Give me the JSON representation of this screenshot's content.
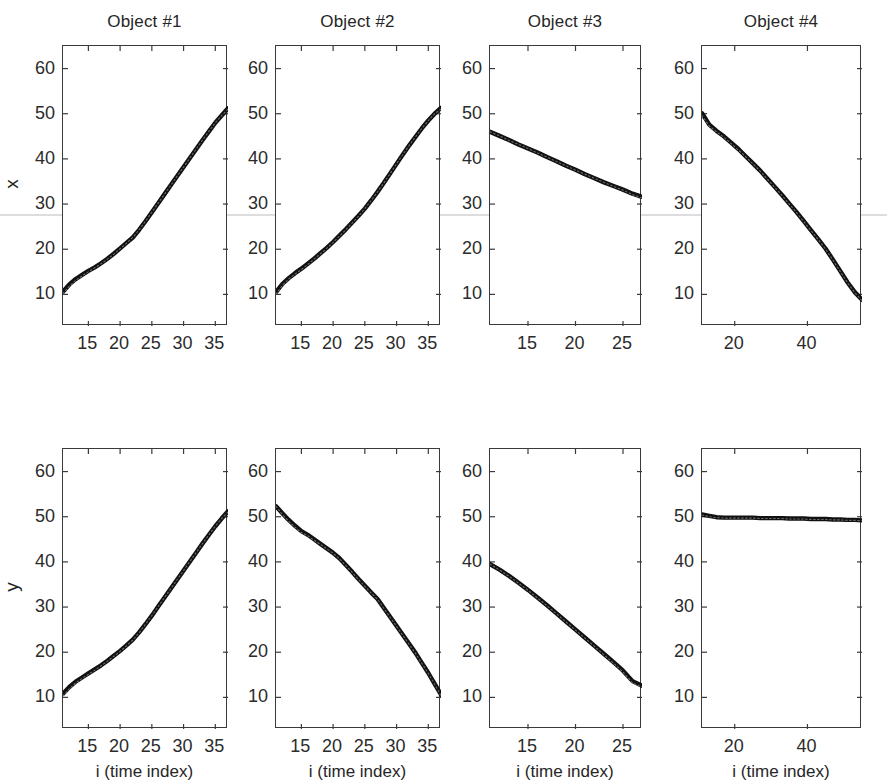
{
  "figure": {
    "row_labels": [
      "x",
      "y"
    ],
    "xlabel": "i (time index)"
  },
  "chart_data": [
    {
      "type": "line",
      "title": "Object #1",
      "panel": "row1-col1",
      "xlabel": "",
      "ylabel": "x",
      "xlim": [
        11,
        37
      ],
      "ylim": [
        3,
        65
      ],
      "xticks": [
        15,
        20,
        25,
        30,
        35
      ],
      "yticks": [
        10,
        20,
        30,
        40,
        50,
        60
      ],
      "grid": false,
      "series": [
        {
          "name": "measured",
          "style": "solid-thick",
          "x": [
            11,
            12,
            13,
            14,
            15,
            16,
            17,
            18,
            19,
            20,
            21,
            22,
            23,
            24,
            25,
            26,
            27,
            28,
            29,
            30,
            31,
            32,
            33,
            34,
            35,
            36,
            37
          ],
          "values": [
            10.6,
            12.2,
            13.4,
            14.3,
            15.2,
            16.0,
            16.9,
            17.9,
            19.0,
            20.2,
            21.4,
            22.6,
            24.3,
            26.2,
            28.2,
            30.2,
            32.2,
            34.2,
            36.2,
            38.2,
            40.2,
            42.2,
            44.2,
            46.1,
            48.0,
            49.6,
            51.2
          ]
        },
        {
          "name": "estimated",
          "style": "dotted-thin",
          "x": [
            11,
            12,
            13,
            14,
            15,
            16,
            17,
            18,
            19,
            20,
            21,
            22,
            23,
            24,
            25,
            26,
            27,
            28,
            29,
            30,
            31,
            32,
            33,
            34,
            35,
            36,
            37
          ],
          "values": [
            10.2,
            11.8,
            13.1,
            14.1,
            15.0,
            15.9,
            16.8,
            17.8,
            18.9,
            20.1,
            21.3,
            22.6,
            24.3,
            26.2,
            28.2,
            30.2,
            32.2,
            34.2,
            36.2,
            38.2,
            40.2,
            42.2,
            44.2,
            46.1,
            48.0,
            49.6,
            51.0
          ]
        }
      ]
    },
    {
      "type": "line",
      "title": "Object #2",
      "panel": "row1-col2",
      "xlabel": "",
      "ylabel": "x",
      "xlim": [
        11,
        37
      ],
      "ylim": [
        3,
        65
      ],
      "xticks": [
        15,
        20,
        25,
        30,
        35
      ],
      "yticks": [
        10,
        20,
        30,
        40,
        50,
        60
      ],
      "grid": false,
      "series": [
        {
          "name": "measured",
          "style": "solid-thick",
          "x": [
            11,
            12,
            13,
            14,
            15,
            16,
            17,
            18,
            19,
            20,
            21,
            22,
            23,
            24,
            25,
            26,
            27,
            28,
            29,
            30,
            31,
            32,
            33,
            34,
            35,
            36,
            37
          ],
          "values": [
            10.5,
            12.3,
            13.6,
            14.7,
            15.7,
            16.8,
            17.9,
            19.1,
            20.3,
            21.6,
            23.0,
            24.4,
            25.9,
            27.4,
            29.0,
            30.8,
            32.7,
            34.7,
            36.8,
            38.9,
            41.0,
            43.0,
            44.9,
            46.8,
            48.5,
            50.0,
            51.3
          ]
        },
        {
          "name": "estimated",
          "style": "dotted-thin",
          "x": [
            11,
            12,
            13,
            14,
            15,
            16,
            17,
            18,
            19,
            20,
            21,
            22,
            23,
            24,
            25,
            26,
            27,
            28,
            29,
            30,
            31,
            32,
            33,
            34,
            35,
            36,
            37
          ],
          "values": [
            10.1,
            12.0,
            13.4,
            14.5,
            15.5,
            16.6,
            17.8,
            19.0,
            20.2,
            21.5,
            22.9,
            24.3,
            25.8,
            27.3,
            29.0,
            30.8,
            32.7,
            34.7,
            36.8,
            38.9,
            41.0,
            43.0,
            44.9,
            46.8,
            48.5,
            50.0,
            51.0
          ]
        }
      ]
    },
    {
      "type": "line",
      "title": "Object #3",
      "panel": "row1-col3",
      "xlabel": "",
      "ylabel": "x",
      "xlim": [
        11,
        27
      ],
      "ylim": [
        3,
        65
      ],
      "xticks": [
        15,
        20,
        25
      ],
      "yticks": [
        10,
        20,
        30,
        40,
        50,
        60
      ],
      "grid": false,
      "series": [
        {
          "name": "measured",
          "style": "solid-thick",
          "x": [
            11,
            12,
            13,
            14,
            15,
            16,
            17,
            18,
            19,
            20,
            21,
            22,
            23,
            24,
            25,
            26,
            27
          ],
          "values": [
            46.0,
            45.1,
            44.2,
            43.2,
            42.3,
            41.4,
            40.4,
            39.5,
            38.5,
            37.6,
            36.6,
            35.7,
            34.8,
            34.0,
            33.2,
            32.3,
            31.6
          ]
        },
        {
          "name": "estimated",
          "style": "dotted-thin",
          "x": [
            11,
            12,
            13,
            14,
            15,
            16,
            17,
            18,
            19,
            20,
            21,
            22,
            23,
            24,
            25,
            26,
            27
          ],
          "values": [
            46.0,
            45.1,
            44.1,
            43.2,
            42.3,
            41.3,
            40.4,
            39.4,
            38.5,
            37.5,
            36.6,
            35.7,
            34.8,
            33.9,
            33.1,
            32.1,
            31.3
          ]
        }
      ]
    },
    {
      "type": "line",
      "title": "Object #4",
      "panel": "row1-col4",
      "xlabel": "",
      "ylabel": "x",
      "xlim": [
        11,
        55
      ],
      "ylim": [
        3,
        65
      ],
      "xticks": [
        20,
        40
      ],
      "yticks": [
        10,
        20,
        30,
        40,
        50,
        60
      ],
      "grid": false,
      "series": [
        {
          "name": "measured",
          "style": "solid-thick",
          "x": [
            11,
            13,
            15,
            17,
            19,
            21,
            23,
            25,
            27,
            29,
            31,
            33,
            35,
            37,
            39,
            41,
            43,
            45,
            47,
            49,
            51,
            53,
            55
          ],
          "values": [
            50.1,
            47.6,
            46.2,
            45.0,
            43.6,
            42.2,
            40.6,
            39.0,
            37.4,
            35.6,
            33.8,
            32.0,
            30.1,
            28.2,
            26.2,
            24.2,
            22.2,
            20.1,
            17.7,
            15.2,
            12.7,
            10.5,
            8.8
          ]
        },
        {
          "name": "estimated",
          "style": "dotted-thin",
          "x": [
            11,
            13,
            15,
            17,
            19,
            21,
            23,
            25,
            27,
            29,
            31,
            33,
            35,
            37,
            39,
            41,
            43,
            45,
            47,
            49,
            51,
            53,
            55
          ],
          "values": [
            49.6,
            47.3,
            46.0,
            44.8,
            43.4,
            42.0,
            40.5,
            38.9,
            37.3,
            35.5,
            33.7,
            31.9,
            30.0,
            28.1,
            26.1,
            24.1,
            22.1,
            20.0,
            17.6,
            15.1,
            12.6,
            10.4,
            8.6
          ]
        }
      ]
    },
    {
      "type": "line",
      "title": "",
      "panel": "row2-col1",
      "xlabel": "i (time index)",
      "ylabel": "y",
      "xlim": [
        11,
        37
      ],
      "ylim": [
        3,
        65
      ],
      "xticks": [
        15,
        20,
        25,
        30,
        35
      ],
      "yticks": [
        10,
        20,
        30,
        40,
        50,
        60
      ],
      "grid": false,
      "series": [
        {
          "name": "measured",
          "style": "solid-thick",
          "x": [
            11,
            12,
            13,
            14,
            15,
            16,
            17,
            18,
            19,
            20,
            21,
            22,
            23,
            24,
            25,
            26,
            27,
            28,
            29,
            30,
            31,
            32,
            33,
            34,
            35,
            36,
            37
          ],
          "values": [
            10.8,
            12.3,
            13.5,
            14.4,
            15.3,
            16.2,
            17.1,
            18.1,
            19.2,
            20.3,
            21.5,
            22.8,
            24.4,
            26.2,
            28.1,
            30.1,
            32.1,
            34.1,
            36.1,
            38.1,
            40.1,
            42.1,
            44.1,
            46.0,
            47.9,
            49.6,
            51.2
          ]
        },
        {
          "name": "estimated",
          "style": "dotted-thin",
          "x": [
            11,
            12,
            13,
            14,
            15,
            16,
            17,
            18,
            19,
            20,
            21,
            22,
            23,
            24,
            25,
            26,
            27,
            28,
            29,
            30,
            31,
            32,
            33,
            34,
            35,
            36,
            37
          ],
          "values": [
            10.3,
            11.9,
            13.2,
            14.2,
            15.1,
            16.0,
            17.0,
            18.0,
            19.1,
            20.2,
            21.4,
            22.7,
            24.3,
            26.2,
            28.1,
            30.1,
            32.1,
            34.1,
            36.1,
            38.1,
            40.1,
            42.1,
            44.1,
            46.0,
            47.9,
            49.6,
            51.0
          ]
        }
      ]
    },
    {
      "type": "line",
      "title": "",
      "panel": "row2-col2",
      "xlabel": "i (time index)",
      "ylabel": "y",
      "xlim": [
        11,
        37
      ],
      "ylim": [
        3,
        65
      ],
      "xticks": [
        15,
        20,
        25,
        30,
        35
      ],
      "yticks": [
        10,
        20,
        30,
        40,
        50,
        60
      ],
      "grid": false,
      "series": [
        {
          "name": "measured",
          "style": "solid-thick",
          "x": [
            11,
            12,
            13,
            14,
            15,
            16,
            17,
            18,
            19,
            20,
            21,
            22,
            23,
            24,
            25,
            26,
            27,
            28,
            29,
            30,
            31,
            32,
            33,
            34,
            35,
            36,
            37
          ],
          "values": [
            52.3,
            50.8,
            49.3,
            48.0,
            46.8,
            46.0,
            45.0,
            44.0,
            43.0,
            42.0,
            40.8,
            39.3,
            37.8,
            36.2,
            34.7,
            33.2,
            31.8,
            29.8,
            27.8,
            25.8,
            23.8,
            21.8,
            19.8,
            17.6,
            15.4,
            13.0,
            10.6
          ]
        },
        {
          "name": "estimated",
          "style": "dotted-thin",
          "x": [
            11,
            12,
            13,
            14,
            15,
            16,
            17,
            18,
            19,
            20,
            21,
            22,
            23,
            24,
            25,
            26,
            27,
            28,
            29,
            30,
            31,
            32,
            33,
            34,
            35,
            36,
            37
          ],
          "values": [
            52.3,
            50.5,
            49.0,
            47.7,
            46.5,
            45.8,
            44.8,
            43.9,
            42.9,
            41.9,
            40.7,
            39.2,
            37.7,
            36.1,
            34.6,
            33.1,
            31.7,
            29.7,
            27.7,
            25.7,
            23.7,
            21.7,
            19.7,
            17.5,
            15.3,
            12.9,
            10.4
          ]
        }
      ]
    },
    {
      "type": "line",
      "title": "",
      "panel": "row2-col3",
      "xlabel": "i (time index)",
      "ylabel": "y",
      "xlim": [
        11,
        27
      ],
      "ylim": [
        3,
        65
      ],
      "xticks": [
        15,
        20,
        25
      ],
      "yticks": [
        10,
        20,
        30,
        40,
        50,
        60
      ],
      "grid": false,
      "series": [
        {
          "name": "measured",
          "style": "solid-thick",
          "x": [
            11,
            12,
            13,
            14,
            15,
            16,
            17,
            18,
            19,
            20,
            21,
            22,
            23,
            24,
            25,
            26,
            27
          ],
          "values": [
            39.5,
            38.3,
            36.9,
            35.4,
            33.8,
            32.1,
            30.4,
            28.6,
            26.8,
            25.0,
            23.2,
            21.4,
            19.6,
            17.8,
            15.9,
            13.6,
            12.6
          ]
        },
        {
          "name": "estimated",
          "style": "dotted-thin",
          "x": [
            11,
            12,
            13,
            14,
            15,
            16,
            17,
            18,
            19,
            20,
            21,
            22,
            23,
            24,
            25,
            26,
            27
          ],
          "values": [
            39.5,
            38.2,
            36.8,
            35.3,
            33.7,
            32.0,
            30.3,
            28.5,
            26.7,
            24.9,
            23.1,
            21.3,
            19.4,
            17.6,
            15.6,
            13.2,
            12.3
          ]
        }
      ]
    },
    {
      "type": "line",
      "title": "",
      "panel": "row2-col4",
      "xlabel": "i (time index)",
      "ylabel": "y",
      "xlim": [
        11,
        55
      ],
      "ylim": [
        3,
        65
      ],
      "xticks": [
        20,
        40
      ],
      "yticks": [
        10,
        20,
        30,
        40,
        50,
        60
      ],
      "grid": false,
      "series": [
        {
          "name": "measured",
          "style": "solid-thick",
          "x": [
            11,
            13,
            15,
            17,
            19,
            21,
            23,
            25,
            27,
            29,
            31,
            33,
            35,
            37,
            39,
            41,
            43,
            45,
            47,
            49,
            51,
            53,
            55
          ],
          "values": [
            50.5,
            50.2,
            49.9,
            49.8,
            49.8,
            49.8,
            49.8,
            49.8,
            49.7,
            49.7,
            49.7,
            49.7,
            49.6,
            49.6,
            49.6,
            49.5,
            49.5,
            49.5,
            49.4,
            49.4,
            49.3,
            49.3,
            49.2
          ]
        },
        {
          "name": "estimated",
          "style": "dotted-thin",
          "x": [
            11,
            13,
            15,
            17,
            19,
            21,
            23,
            25,
            27,
            29,
            31,
            33,
            35,
            37,
            39,
            41,
            43,
            45,
            47,
            49,
            51,
            53,
            55
          ],
          "values": [
            50.4,
            50.0,
            49.8,
            49.7,
            49.7,
            49.7,
            49.7,
            49.7,
            49.6,
            49.6,
            49.6,
            49.6,
            49.5,
            49.5,
            49.5,
            49.4,
            49.4,
            49.4,
            49.3,
            49.3,
            49.2,
            49.2,
            49.1
          ]
        }
      ]
    }
  ]
}
